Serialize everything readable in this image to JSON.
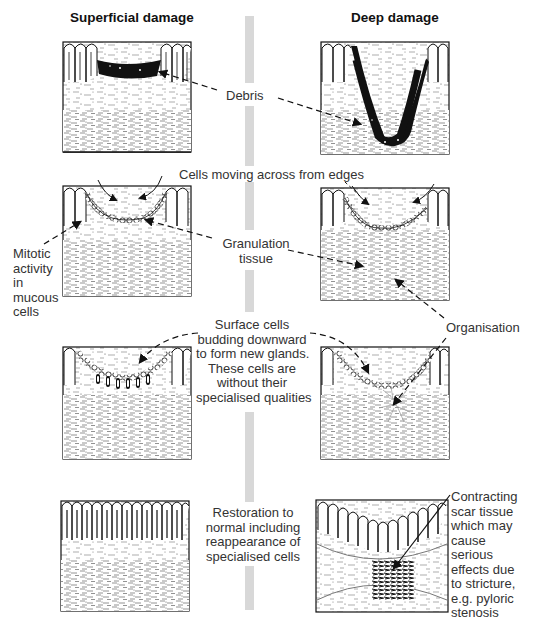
{
  "diagram": {
    "title_left": "Superficial damage",
    "title_right": "Deep damage",
    "stages": [
      {
        "name": "debris",
        "labels": [
          "Debris"
        ]
      },
      {
        "name": "cell-migration",
        "labels": [
          "Cells moving across from edges",
          "Granulation",
          "tissue",
          "Mitotic",
          "activity",
          "in",
          "mucous",
          "cells"
        ]
      },
      {
        "name": "new-glands",
        "labels": [
          "Surface cells",
          "budding downward",
          "to form new glands.",
          "These cells are",
          "without their",
          "specialised qualities",
          "Organisation"
        ]
      },
      {
        "name": "outcome",
        "labels": [
          "Restoration to",
          "normal including",
          "reappearance of",
          "specialised cells",
          "Contracting",
          "scar tissue",
          "which may",
          "cause",
          "serious",
          "effects due",
          "to stricture,",
          "e.g. pyloric",
          "stenosis"
        ]
      }
    ],
    "colors": {
      "ink": "#111111",
      "divider": "#d8d8d8",
      "text": "#333333"
    }
  }
}
